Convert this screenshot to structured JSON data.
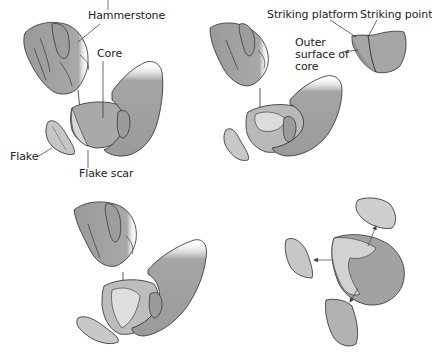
{
  "figure": {
    "title_fragment": "",
    "panels": [
      {
        "id": "panel-1",
        "position": "top-left",
        "description": "Hand holding hammerstone strikes core held in other hand; flake detaches",
        "labels": {
          "hammerstone": "Hammerstone",
          "core": "Core",
          "flake": "Flake",
          "flake_scar": "Flake scar"
        }
      },
      {
        "id": "panel-2",
        "position": "top-right",
        "description": "Second strike on core; inset detail of striking platform",
        "labels": {
          "striking_platform": "Striking platform",
          "striking_point": "Striking point",
          "outer_surface": "Outer surface of core"
        }
      },
      {
        "id": "panel-3",
        "position": "bottom-left",
        "description": "Third strike on core with arrow indicating strike point; flake below"
      },
      {
        "id": "panel-4",
        "position": "bottom-right",
        "description": "Core with three detached flakes, arrows showing direction of removal",
        "arrows": 3
      }
    ]
  },
  "colors": {
    "skin": "#9a9a9a",
    "skin_dark": "#7d7d7d",
    "stone_light": "#d4d4d4",
    "stone_mid": "#b3b3b3",
    "stone_dark": "#8a8a8a",
    "outline": "#2b2b2b",
    "text": "#222222"
  }
}
